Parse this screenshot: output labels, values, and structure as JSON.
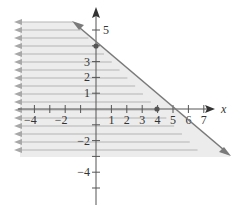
{
  "chart_data": {
    "type": "area",
    "title": "",
    "xlabel": "x",
    "ylabel": "",
    "xlim": [
      -5,
      7.5
    ],
    "ylim": [
      -6.5,
      6
    ],
    "grid": false,
    "x_tick_labels": [
      "-4",
      "-2",
      "1",
      "2",
      "3",
      "4",
      "5",
      "6",
      "7"
    ],
    "x_ticks": [
      -4,
      -3,
      -2,
      -1,
      1,
      2,
      3,
      4,
      5,
      6,
      7
    ],
    "y_tick_labels": [
      "5",
      "3",
      "2",
      "1",
      "-2",
      "-4"
    ],
    "y_ticks": [
      5,
      4,
      3,
      2,
      1,
      -1,
      -2,
      -3,
      -4,
      -5
    ],
    "boundary_line": {
      "equation": "x + y = 4",
      "style": "solid",
      "points": [
        [
          -1.5,
          5.5
        ],
        [
          8.6,
          -4.1
        ]
      ],
      "intercepts": [
        [
          0,
          4
        ],
        [
          4,
          0
        ]
      ]
    },
    "marked_points": [
      [
        0,
        4
      ],
      [
        4,
        0
      ]
    ],
    "shaded_region": "below-left of line (x + y <= 4)",
    "colors": {
      "line": "#7a7a7a",
      "shading": "#e8e8e8",
      "hatch": "#b0b0b0",
      "axis": "#555555",
      "point": "#555555"
    }
  }
}
